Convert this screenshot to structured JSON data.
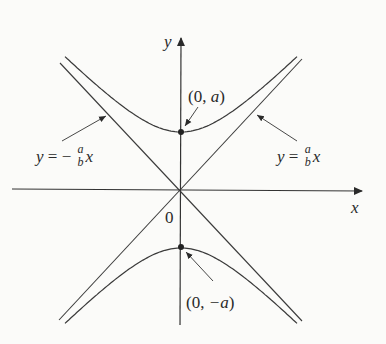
{
  "diagram": {
    "type": "hyperbola",
    "equation_form": "y^2/a^2 - x^2/b^2 = 1",
    "axes": {
      "x_label": "x",
      "y_label": "y",
      "origin_label": "0"
    },
    "vertices": {
      "top": {
        "label_prefix": "(0, ",
        "label_var": "a",
        "label_suffix": ")"
      },
      "bottom": {
        "label_prefix": "(0, ",
        "label_var": "−a",
        "label_suffix": ")"
      }
    },
    "asymptotes": {
      "negative": {
        "lhs": "y",
        "eq": " = − ",
        "num": "a",
        "den": "b",
        "rhs": "x"
      },
      "positive": {
        "lhs": "y",
        "eq": " = ",
        "num": "a",
        "den": "b",
        "rhs": "x"
      }
    },
    "colors": {
      "line": "#3a3a3a",
      "background": "#fbfbf9"
    }
  }
}
